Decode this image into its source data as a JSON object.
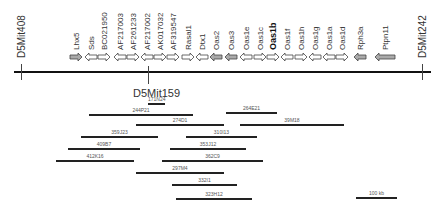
{
  "figure": {
    "type": "physical map",
    "markers": [
      {
        "id": "m408",
        "label": "D5Mit408",
        "x": 21
      },
      {
        "id": "m159",
        "label": "D5Mit159",
        "x": 148
      },
      {
        "id": "m242",
        "label": "D5Mit242",
        "x": 422
      }
    ],
    "genes": [
      {
        "label": "Lhx5",
        "x": 76,
        "dir": "right",
        "bold": false,
        "shade": "gray"
      },
      {
        "label": "Sds",
        "x": 91,
        "dir": "left",
        "bold": false,
        "shade": "white"
      },
      {
        "label": "BC021950",
        "x": 104,
        "dir": "right",
        "bold": false,
        "shade": "white"
      },
      {
        "label": "AF217003",
        "x": 120,
        "dir": "left",
        "bold": false,
        "shade": "white"
      },
      {
        "label": "AF261233",
        "x": 133,
        "dir": "right",
        "bold": false,
        "shade": "white"
      },
      {
        "label": "AF217002",
        "x": 147,
        "dir": "left",
        "bold": false,
        "shade": "white"
      },
      {
        "label": "AK017032",
        "x": 160,
        "dir": "right",
        "bold": false,
        "shade": "white"
      },
      {
        "label": "AF319547",
        "x": 173,
        "dir": "right",
        "bold": false,
        "shade": "white"
      },
      {
        "label": "Rasal1",
        "x": 188,
        "dir": "right",
        "bold": false,
        "shade": "white"
      },
      {
        "label": "Dtx1",
        "x": 202,
        "dir": "left",
        "bold": false,
        "shade": "white"
      },
      {
        "label": "Oas2",
        "x": 216,
        "dir": "left",
        "bold": false,
        "shade": "gray"
      },
      {
        "label": "Oas3",
        "x": 231,
        "dir": "left",
        "bold": false,
        "shade": "gray"
      },
      {
        "label": "Oas1e",
        "x": 246,
        "dir": "left",
        "bold": false,
        "shade": "white"
      },
      {
        "label": "Oas1c",
        "x": 260,
        "dir": "right",
        "bold": false,
        "shade": "white"
      },
      {
        "label": "Oas1b",
        "x": 273,
        "dir": "right",
        "bold": true,
        "shade": "white"
      },
      {
        "label": "Oas1f",
        "x": 287,
        "dir": "left",
        "bold": false,
        "shade": "white"
      },
      {
        "label": "Oas1h",
        "x": 301,
        "dir": "right",
        "bold": false,
        "shade": "white"
      },
      {
        "label": "Oas1g",
        "x": 315,
        "dir": "left",
        "bold": false,
        "shade": "white"
      },
      {
        "label": "Oas1a",
        "x": 329,
        "dir": "left",
        "bold": false,
        "shade": "white"
      },
      {
        "label": "Oas1d",
        "x": 342,
        "dir": "right",
        "bold": false,
        "shade": "white"
      },
      {
        "label": "Rph3a",
        "x": 360,
        "dir": "left",
        "bold": false,
        "shade": "gray"
      },
      {
        "label": "Ptpn11",
        "x": 385,
        "dir": "left",
        "bold": false,
        "shade": "gray"
      }
    ],
    "bac_clones": [
      {
        "label": "171N24",
        "x1": 148,
        "x2": 165,
        "y": 103
      },
      {
        "label": "244P21",
        "x1": 89,
        "x2": 193,
        "y": 114
      },
      {
        "label": "264E21",
        "x1": 226,
        "x2": 277,
        "y": 112
      },
      {
        "label": "274D1",
        "x1": 136,
        "x2": 224,
        "y": 124
      },
      {
        "label": "39M18",
        "x1": 240,
        "x2": 344,
        "y": 124
      },
      {
        "label": "359J23",
        "x1": 81,
        "x2": 158,
        "y": 136
      },
      {
        "label": "310I13",
        "x1": 186,
        "x2": 257,
        "y": 136
      },
      {
        "label": "409B7",
        "x1": 68,
        "x2": 140,
        "y": 148
      },
      {
        "label": "353J12",
        "x1": 170,
        "x2": 246,
        "y": 148
      },
      {
        "label": "412K16",
        "x1": 56,
        "x2": 134,
        "y": 160
      },
      {
        "label": "362C9",
        "x1": 162,
        "x2": 263,
        "y": 160
      },
      {
        "label": "297M4",
        "x1": 136,
        "x2": 224,
        "y": 172
      },
      {
        "label": "332I1",
        "x1": 172,
        "x2": 237,
        "y": 184
      },
      {
        "label": "323H12",
        "x1": 176,
        "x2": 252,
        "y": 198
      }
    ],
    "scale_bar": {
      "label": "100 kb",
      "x1": 356,
      "x2": 397,
      "y": 197
    }
  }
}
